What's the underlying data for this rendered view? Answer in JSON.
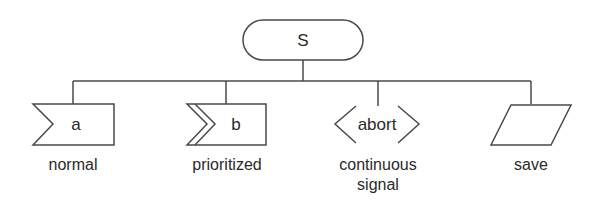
{
  "diagram": {
    "type": "tree",
    "root": {
      "label": "S",
      "shape": "rounded-rectangle"
    },
    "children": [
      {
        "label": "a",
        "shape": "notched-flag",
        "caption_lines": [
          "normal"
        ]
      },
      {
        "label": "b",
        "shape": "double-notched-flag",
        "caption_lines": [
          "prioritized"
        ]
      },
      {
        "label": "abort",
        "shape": "angle-brackets",
        "caption_lines": [
          "continuous",
          "signal"
        ]
      },
      {
        "label": "",
        "shape": "parallelogram",
        "caption_lines": [
          "save"
        ]
      }
    ],
    "colors": {
      "line": "#4a4a4a",
      "text": "#2a2a2a",
      "background": "#ffffff"
    }
  }
}
